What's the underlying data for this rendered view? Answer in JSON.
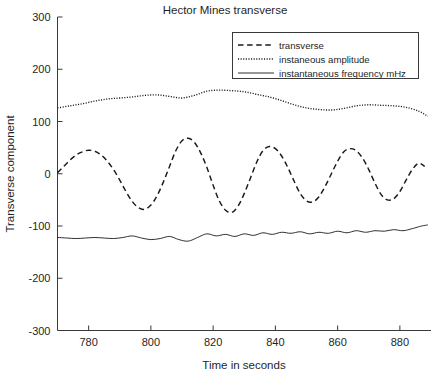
{
  "chart_data": {
    "type": "line",
    "title": "Hector Mines transverse",
    "xlabel": "Time in seconds",
    "ylabel": "Transverse component",
    "xlim": [
      770,
      890
    ],
    "ylim": [
      -300,
      300
    ],
    "xticks": [
      780,
      800,
      820,
      840,
      860,
      880
    ],
    "yticks": [
      300,
      200,
      100,
      0,
      -100,
      -200,
      -300
    ],
    "grid": false,
    "legend_position": "top-right",
    "series": [
      {
        "name": "transverse",
        "style": "dashed",
        "x": [
          770,
          772,
          774,
          776,
          778,
          780,
          782,
          784,
          786,
          788,
          790,
          792,
          794,
          796,
          798,
          800,
          802,
          804,
          806,
          808,
          810,
          812,
          814,
          816,
          818,
          820,
          822,
          824,
          826,
          828,
          830,
          832,
          834,
          836,
          838,
          840,
          842,
          844,
          846,
          848,
          850,
          852,
          854,
          856,
          858,
          860,
          862,
          864,
          866,
          868,
          870,
          872,
          874,
          876,
          878,
          880,
          882,
          884,
          886,
          888
        ],
        "y": [
          2,
          14,
          26,
          36,
          42,
          45,
          43,
          36,
          24,
          8,
          -12,
          -34,
          -53,
          -65,
          -68,
          -60,
          -42,
          -16,
          14,
          44,
          63,
          68,
          60,
          40,
          12,
          -22,
          -52,
          -70,
          -74,
          -62,
          -38,
          -8,
          22,
          44,
          52,
          48,
          34,
          12,
          -14,
          -38,
          -52,
          -54,
          -44,
          -24,
          0,
          24,
          42,
          48,
          44,
          30,
          8,
          -18,
          -40,
          -50,
          -48,
          -34,
          -12,
          8,
          20,
          14
        ]
      },
      {
        "name": "instaneous amplitude",
        "style": "dotted",
        "x": [
          770,
          774,
          778,
          782,
          786,
          790,
          794,
          798,
          802,
          806,
          810,
          814,
          818,
          822,
          826,
          830,
          834,
          838,
          842,
          846,
          850,
          854,
          858,
          862,
          866,
          870,
          874,
          878,
          882,
          886,
          889
        ],
        "y": [
          126,
          130,
          134,
          139,
          143,
          145,
          147,
          150,
          151,
          148,
          145,
          150,
          158,
          160,
          159,
          157,
          152,
          147,
          140,
          132,
          126,
          123,
          122,
          125,
          130,
          132,
          131,
          130,
          127,
          120,
          110
        ]
      },
      {
        "name": "instantaneous frequency mHz",
        "style": "solid",
        "x": [
          770,
          773,
          776,
          779,
          782,
          785,
          788,
          791,
          794,
          797,
          800,
          803,
          806,
          809,
          812,
          815,
          818,
          821,
          824,
          827,
          830,
          833,
          836,
          839,
          842,
          845,
          848,
          851,
          854,
          857,
          860,
          863,
          866,
          869,
          872,
          875,
          878,
          881,
          884,
          887,
          889
        ],
        "y": [
          -122,
          -123,
          -124,
          -123,
          -122,
          -123,
          -124,
          -122,
          -119,
          -123,
          -126,
          -124,
          -120,
          -126,
          -129,
          -122,
          -115,
          -119,
          -116,
          -120,
          -115,
          -118,
          -113,
          -116,
          -112,
          -114,
          -111,
          -115,
          -112,
          -114,
          -110,
          -113,
          -109,
          -112,
          -109,
          -110,
          -107,
          -109,
          -105,
          -100,
          -98
        ]
      }
    ]
  },
  "legend": {
    "entries": [
      {
        "label": "transverse",
        "style": "dashed"
      },
      {
        "label": "instaneous amplitude",
        "style": "dotted"
      },
      {
        "label": "instantaneous frequency mHz",
        "style": "solid"
      }
    ]
  },
  "colors": {
    "background": "#ffffff",
    "axis": "#3a3a3a",
    "series": "#1a1a1a"
  }
}
